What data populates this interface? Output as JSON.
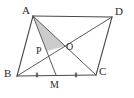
{
  "figure": {
    "background_color": "#ffffff",
    "line_color": "#4a4a4a",
    "shade_color": "#c9c9c9",
    "label_color": "#2a2a2a",
    "labels": {
      "A": "A",
      "B": "B",
      "C": "C",
      "D": "D",
      "M": "M",
      "O": "O",
      "P": "P"
    }
  },
  "chart_data": {
    "type": "diagram",
    "points": {
      "A": [
        33,
        16
      ],
      "B": [
        17,
        76
      ],
      "C": [
        96,
        75
      ],
      "D": [
        112,
        17
      ],
      "M": [
        56,
        75
      ],
      "O": [
        65,
        46
      ],
      "P": [
        47,
        51
      ]
    },
    "segments": [
      {
        "name": "AD",
        "from": "A",
        "to": "D"
      },
      {
        "name": "AB",
        "from": "A",
        "to": "B"
      },
      {
        "name": "BC",
        "from": "B",
        "to": "C"
      },
      {
        "name": "DC",
        "from": "D",
        "to": "C"
      },
      {
        "name": "AC",
        "from": "A",
        "to": "C"
      },
      {
        "name": "BD",
        "from": "B",
        "to": "D"
      },
      {
        "name": "AM",
        "from": "A",
        "to": "M"
      }
    ],
    "shaded_region": {
      "name": "triangle-APO",
      "vertices": [
        "A",
        "P",
        "O"
      ]
    },
    "tick_marks": [
      {
        "name": "BM",
        "segment": [
          "B",
          "M"
        ],
        "count": 2,
        "at": [
          37,
          75
        ]
      },
      {
        "name": "MC",
        "segment": [
          "M",
          "C"
        ],
        "count": 2,
        "at": [
          76,
          75
        ]
      }
    ],
    "label_positions": {
      "A": [
        22,
        5
      ],
      "B": [
        4,
        68
      ],
      "C": [
        99,
        66
      ],
      "D": [
        115,
        6
      ],
      "M": [
        50,
        79
      ],
      "O": [
        66,
        41
      ],
      "P": [
        36,
        45
      ]
    }
  }
}
